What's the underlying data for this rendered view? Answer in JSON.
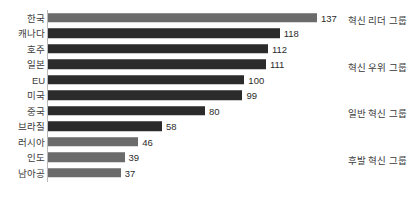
{
  "chart_data": {
    "type": "bar",
    "orientation": "horizontal",
    "title": "",
    "subtitle": "",
    "xlabel": "",
    "ylabel": "",
    "grid": false,
    "legend": "none",
    "xlim": [
      0,
      140
    ],
    "categories": [
      "한국",
      "캐나다",
      "호주",
      "일본",
      "EU",
      "미국",
      "중국",
      "브라질",
      "러시아",
      "인도",
      "남아공"
    ],
    "values": [
      137,
      118,
      112,
      111,
      100,
      99,
      80,
      58,
      46,
      39,
      37
    ],
    "bar_colors": [
      "#6b6b6b",
      "#2b2b2b",
      "#2b2b2b",
      "#2b2b2b",
      "#2b2b2b",
      "#2b2b2b",
      "#2b2b2b",
      "#2b2b2b",
      "#6b6b6b",
      "#6b6b6b",
      "#6b6b6b"
    ],
    "annotations": [
      {
        "text": "혁신 리더 그룹",
        "row": 0
      },
      {
        "text": "혁신 우위 그룹",
        "row": 3
      },
      {
        "text": "일반 혁신 그룹",
        "row": 6
      },
      {
        "text": "후발 혁신 그룹",
        "row": 9
      }
    ]
  },
  "colors": {
    "bar_light": "#6b6b6b",
    "bar_dark": "#2b2b2b",
    "axis": "#b9b9b9",
    "text": "#3b3b3b",
    "background": "#ffffff"
  }
}
